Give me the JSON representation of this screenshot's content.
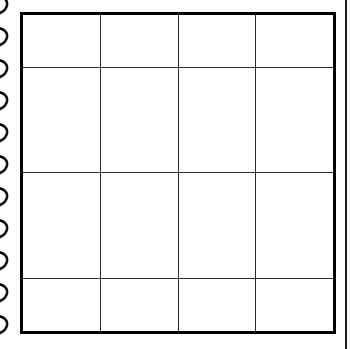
{
  "document": {
    "type": "spiral-bound notebook page",
    "background_color": "#ffffff",
    "paper_color": "#fefefe"
  },
  "binding": {
    "icon": "spiral-coil-icon",
    "side": "left",
    "coil_color": "#111111",
    "coil_count": 11,
    "coil_spacing_px": 32,
    "coil_first_top_px": -6
  },
  "grid": {
    "name": "empty-4x4-grid",
    "rows": 4,
    "columns": 4,
    "border_color": "#000000",
    "border_width_px": 3,
    "inner_line_color": "#2b2b2b",
    "inner_line_width_px": 1,
    "cell_background": "#ffffff",
    "left_px": 20,
    "top_px": 12,
    "width_px": 316,
    "height_px": 322,
    "cells": [
      [
        "",
        "",
        "",
        ""
      ],
      [
        "",
        "",
        "",
        ""
      ],
      [
        "",
        "",
        "",
        ""
      ],
      [
        "",
        "",
        "",
        ""
      ]
    ]
  },
  "page_edge": {
    "name": "adjacent-page-edge",
    "color": "#1a1a1a",
    "left_px": 345,
    "width_px": 2
  }
}
